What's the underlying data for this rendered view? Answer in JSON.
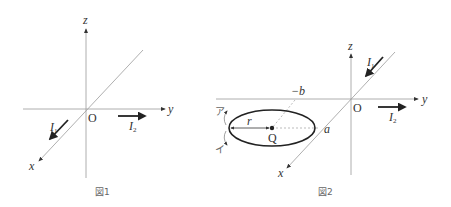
{
  "figure1": {
    "caption": "図1",
    "axes": {
      "x": "x",
      "y": "y",
      "z": "z"
    },
    "origin": "O",
    "currents": [
      {
        "name": "I",
        "sub": "1",
        "direction": "+x (along x-axis)"
      },
      {
        "name": "I",
        "sub": "2",
        "direction": "+y (along y-axis)"
      }
    ]
  },
  "figure2": {
    "caption": "図2",
    "axes": {
      "x": "x",
      "y": "y",
      "z": "z"
    },
    "origin": "O",
    "currents": [
      {
        "name": "I",
        "sub": "1",
        "direction": "+x (along x-axis)"
      },
      {
        "name": "I",
        "sub": "2",
        "direction": "+y (parallel to y-axis)"
      }
    ],
    "point": "Q",
    "radius": "r",
    "labels": {
      "neg_b": "−b",
      "a": "a"
    },
    "rotation_labels": {
      "a_dir": "ア",
      "i_dir": "イ"
    }
  },
  "colors": {
    "axis": "#9a9a9a",
    "arrow": "#222222",
    "ellipse": "#222222",
    "caption": "#666666"
  }
}
